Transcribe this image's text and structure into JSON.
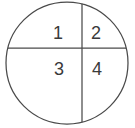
{
  "figure": {
    "name": "circle-four-regions",
    "background_color": "#ffffff",
    "stroke_color": "#4a4a4a",
    "label_color": "#3a3a3a",
    "circle": {
      "center_x": 67,
      "center_y": 63,
      "radius": 61
    },
    "dividers": {
      "horizontal": {
        "y": 48,
        "label": "horizontal-chord"
      },
      "vertical": {
        "x": 82,
        "label": "vertical-chord"
      }
    },
    "regions": [
      {
        "id": "region-1",
        "label": "1",
        "x": 58,
        "y": 34,
        "position": "upper-left"
      },
      {
        "id": "region-2",
        "label": "2",
        "x": 96,
        "y": 34,
        "position": "upper-right"
      },
      {
        "id": "region-3",
        "label": "3",
        "x": 59,
        "y": 70,
        "position": "lower-left"
      },
      {
        "id": "region-4",
        "label": "4",
        "x": 97,
        "y": 70,
        "position": "lower-right"
      }
    ]
  }
}
